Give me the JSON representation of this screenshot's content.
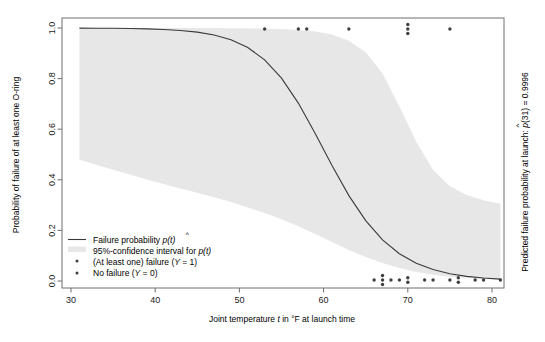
{
  "chart_data": {
    "type": "line",
    "title": "",
    "xlabel": "Joint temperature t in °F at launch time",
    "ylabel": "Probability of failure of at least one O-ring",
    "right_label": "Predicted failure probability at launch: p̂(31) = 0.9996",
    "xlim": [
      30,
      81.5
    ],
    "ylim": [
      0.0,
      1.0
    ],
    "xticks": [
      30,
      40,
      50,
      60,
      70,
      80
    ],
    "xticklabels": [
      "30",
      "40",
      "50",
      "60",
      "70",
      "80"
    ],
    "yticks": [
      0.0,
      0.2,
      0.4,
      0.6,
      0.8,
      1.0
    ],
    "yticklabels": [
      "0.0",
      "0.2",
      "0.4",
      "0.6",
      "0.8",
      "1.0"
    ],
    "grid": false,
    "legend_position": "lower-left",
    "band_color": "#e7e7e7",
    "curve_color": "#3a3a3a",
    "point_color": "#3f3f3f",
    "frame_color": "#6e6e6e",
    "series": [
      {
        "name": "Failure probability p̂(t)",
        "type": "line",
        "x": [
          31,
          33,
          35,
          37,
          39,
          41,
          43,
          45,
          47,
          49,
          51,
          53,
          55,
          57,
          59,
          61,
          63,
          65,
          67,
          69,
          71,
          73,
          75,
          77,
          79,
          81
        ],
        "values": [
          0.9996,
          0.9993,
          0.9988,
          0.998,
          0.9966,
          0.9943,
          0.9903,
          0.9836,
          0.9723,
          0.9535,
          0.9227,
          0.8741,
          0.8018,
          0.7032,
          0.5834,
          0.4561,
          0.3374,
          0.2384,
          0.1626,
          0.1079,
          0.0703,
          0.0452,
          0.0288,
          0.0183,
          0.0116,
          0.0073
        ]
      },
      {
        "name": "95%-confidence interval for p(t)",
        "type": "band",
        "x": [
          31,
          33,
          35,
          37,
          39,
          41,
          43,
          45,
          47,
          49,
          51,
          53,
          55,
          57,
          59,
          61,
          63,
          65,
          67,
          69,
          71,
          73,
          75,
          77,
          79,
          81
        ],
        "lower": [
          0.479,
          0.4595,
          0.44,
          0.4205,
          0.401,
          0.383,
          0.366,
          0.349,
          0.331,
          0.312,
          0.291,
          0.269,
          0.244,
          0.216,
          0.186,
          0.154,
          0.123,
          0.095,
          0.071,
          0.051,
          0.036,
          0.025,
          0.017,
          0.0115,
          0.0075,
          0.0048
        ],
        "upper": [
          1.0,
          1.0,
          1.0,
          1.0,
          1.0,
          1.0,
          0.9999,
          0.9998,
          0.9996,
          0.9993,
          0.9988,
          0.9978,
          0.996,
          0.9925,
          0.986,
          0.974,
          0.95,
          0.904,
          0.82,
          0.69,
          0.55,
          0.44,
          0.375,
          0.34,
          0.319,
          0.305
        ]
      },
      {
        "name": "(At least one) failure (Y = 1)",
        "type": "scatter",
        "y_value": 1,
        "points": [
          53,
          57,
          58,
          63,
          70,
          70,
          70,
          75
        ]
      },
      {
        "name": "No failure (Y = 0)",
        "type": "scatter",
        "y_value": 0,
        "points": [
          66,
          67,
          67,
          67,
          68,
          69,
          70,
          70,
          72,
          73,
          75,
          76,
          76,
          78,
          79,
          81
        ]
      }
    ],
    "legend_entries": [
      {
        "label": "Failure probability p̂(t)",
        "marker": "line"
      },
      {
        "label": "95%-confidence interval for p(t)",
        "marker": "swatch"
      },
      {
        "label": "(At least one) failure (Y = 1)",
        "marker": "dot"
      },
      {
        "label": "No failure (Y = 0)",
        "marker": "dot"
      }
    ]
  },
  "labels": {
    "y_axis_title": "Probability of failure of at least one O-ring",
    "x_axis_title_part1": "Joint temperature ",
    "x_axis_title_italic": "t",
    "x_axis_title_part2": " in °F at launch time",
    "right_axis_prefix": "Predicted failure probability at launch: ",
    "right_axis_hat": "p",
    "right_axis_suffix": "(31) = 0.9996",
    "legend_1": "Failure probability ",
    "legend_1_italic": "p",
    "legend_1_tail": "(t)",
    "legend_2_prefix": "95%-confidence interval for ",
    "legend_2_italic": "p",
    "legend_2_tail": "(t)",
    "legend_3": "(At least one) failure (",
    "legend_3_italic": "Y",
    "legend_3_tail": " = 1)",
    "legend_4": "No failure (",
    "legend_4_italic": "Y",
    "legend_4_tail": " = 0)"
  },
  "ticks": {
    "x": [
      "30",
      "40",
      "50",
      "60",
      "70",
      "80"
    ],
    "y": [
      "0.0",
      "0.2",
      "0.4",
      "0.6",
      "0.8",
      "1.0"
    ]
  }
}
